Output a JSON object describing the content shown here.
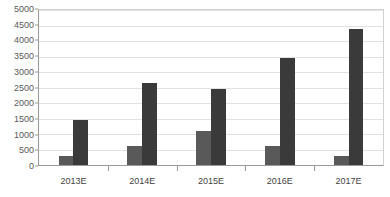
{
  "chart_data": {
    "type": "bar",
    "title": "",
    "subtitle": "",
    "xlabel": "",
    "ylabel": "",
    "categories": [
      "2013E",
      "2014E",
      "2015E",
      "2016E",
      "2017E"
    ],
    "series": [
      {
        "name": "Series 1",
        "color": "#595959",
        "values": [
          300,
          600,
          1100,
          600,
          300
        ]
      },
      {
        "name": "Series 2",
        "color": "#3a3a3a",
        "values": [
          1450,
          2650,
          2450,
          3450,
          4400
        ]
      }
    ],
    "ylim": [
      0,
      5000
    ],
    "ytick_step": 500,
    "ytick_labels": [
      "0",
      "500",
      "1000",
      "1500",
      "2000",
      "2500",
      "3000",
      "3500",
      "4000",
      "4500",
      "5000"
    ],
    "grid": true,
    "grid_axis": "y",
    "legend": false,
    "legend_position": "none",
    "annotations": [],
    "gridline_color": "#e2e2e2",
    "axis_color": "#9a9a9a",
    "plot_background": "#ffffff"
  }
}
